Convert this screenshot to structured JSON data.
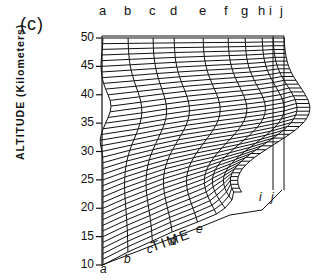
{
  "figure": {
    "panel_label": "(c)",
    "y_axis_label": "ALTITUDE (Kilometers)",
    "x_axis_label": "TIME",
    "y_ticks": [
      "50",
      "45",
      "40",
      "35",
      "30",
      "25",
      "20",
      "15",
      "10"
    ],
    "top_curve_labels": [
      "a",
      "b",
      "c",
      "d",
      "e",
      "f",
      "g",
      "h",
      "i",
      "j"
    ],
    "bottom_curve_labels": [
      "a",
      "b",
      "c",
      "d",
      "e"
    ],
    "bottom_right_labels": [
      "i",
      "j"
    ]
  },
  "chart_data": {
    "type": "surface-wireframe",
    "title": "(c)",
    "ylabel": "ALTITUDE (Kilometers)",
    "xlabel": "TIME",
    "ylim": [
      10,
      50
    ],
    "y_ticks": [
      10,
      15,
      20,
      25,
      30,
      35,
      40,
      45,
      50
    ],
    "time_profiles": [
      "a",
      "b",
      "c",
      "d",
      "e",
      "f",
      "g",
      "h",
      "i",
      "j"
    ]
  }
}
